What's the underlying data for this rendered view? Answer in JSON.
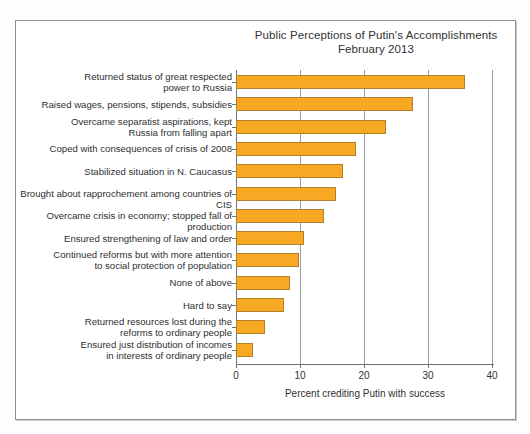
{
  "chart_data": {
    "type": "bar",
    "orientation": "horizontal",
    "title": "Public Perceptions of Putin's Accomplishments",
    "subtitle": "February 2013",
    "xlabel": "Percent crediting Putin with success",
    "ylabel": "",
    "xlim": [
      0,
      40
    ],
    "xticks": [
      0,
      10,
      20,
      30,
      40
    ],
    "xtick_labels": [
      "0",
      "10",
      "20",
      "30",
      "40"
    ],
    "grid": true,
    "grid_axis": "x",
    "legend": false,
    "bar_color": "#F7A923",
    "bar_edge_color": "#B3802A",
    "categories": [
      "Returned status of great respected power to Russia",
      "Raised wages, pensions, stipends, subsidies",
      "Overcame separatist aspirations, kept Russia from falling apart",
      "Coped with consequences of crisis of 2008",
      "Stabilized situation in N. Caucasus",
      "Brought about rapprochement among countries of CIS",
      "Overcame crisis in economy; stopped fall of production",
      "Ensured strengthening of law and order",
      "Continued reforms but with more attention to social protection of population",
      "None of above",
      "Hard to say",
      "Returned resources lost during the reforms to ordinary people",
      "Ensured just distribution of incomes in interests of ordinary people"
    ],
    "category_lines": [
      [
        "Returned status of great respected",
        "power to Russia"
      ],
      [
        "Raised wages, pensions, stipends, subsidies"
      ],
      [
        "Overcame separatist aspirations, kept",
        "Russia from falling apart"
      ],
      [
        "Coped with consequences of crisis of 2008"
      ],
      [
        "Stabilized situation in N. Caucasus"
      ],
      [
        "Brought about rapprochement among countries of CIS"
      ],
      [
        "Overcame crisis in economy; stopped fall of production"
      ],
      [
        "Ensured strengthening of law and order"
      ],
      [
        "Continued reforms but with more attention",
        "to social protection of population"
      ],
      [
        "None of above"
      ],
      [
        "Hard to say"
      ],
      [
        "Returned resources lost during the",
        "reforms to ordinary people"
      ],
      [
        "Ensured just distribution of incomes",
        "in interests of ordinary people"
      ]
    ],
    "values": [
      35.8,
      27.6,
      23.5,
      18.8,
      16.7,
      15.6,
      13.7,
      10.7,
      9.8,
      8.4,
      7.5,
      4.6,
      2.7
    ]
  }
}
